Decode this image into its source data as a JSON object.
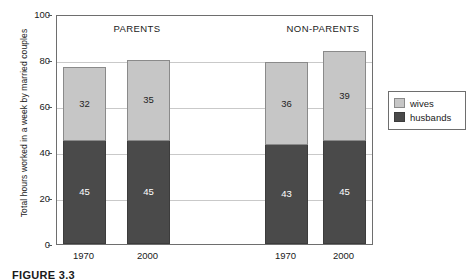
{
  "figure": {
    "caption": "FIGURE 3.3"
  },
  "legend": {
    "position": "right",
    "items": [
      {
        "label": "wives",
        "color": "#c6c6c6",
        "icon": "legend-swatch-icon"
      },
      {
        "label": "husbands",
        "color": "#4a4a4a",
        "icon": "legend-swatch-icon"
      }
    ]
  },
  "chart_data": {
    "type": "bar",
    "stacked": true,
    "title": "",
    "xlabel": "",
    "ylabel": "Total hours worked in a week by married couples",
    "ylim": [
      0,
      100
    ],
    "yticks": [
      0,
      20,
      40,
      60,
      80,
      100
    ],
    "grid": true,
    "groups": [
      "PARENTS",
      "NON-PARENTS"
    ],
    "categories": [
      "1970",
      "2000",
      "1970",
      "2000"
    ],
    "series": [
      {
        "name": "husbands",
        "color": "#4a4a4a",
        "values": [
          45,
          45,
          43,
          45
        ]
      },
      {
        "name": "wives",
        "color": "#c6c6c6",
        "values": [
          32,
          35,
          36,
          39
        ]
      }
    ],
    "totals": [
      77,
      80,
      79,
      84
    ],
    "bars": [
      {
        "group": "PARENTS",
        "category": "1970",
        "husbands": 45,
        "wives": 32,
        "total": 77
      },
      {
        "group": "PARENTS",
        "category": "2000",
        "husbands": 45,
        "wives": 35,
        "total": 80
      },
      {
        "group": "NON-PARENTS",
        "category": "1970",
        "husbands": 43,
        "wives": 36,
        "total": 79
      },
      {
        "group": "NON-PARENTS",
        "category": "2000",
        "husbands": 45,
        "wives": 39,
        "total": 84
      }
    ]
  }
}
